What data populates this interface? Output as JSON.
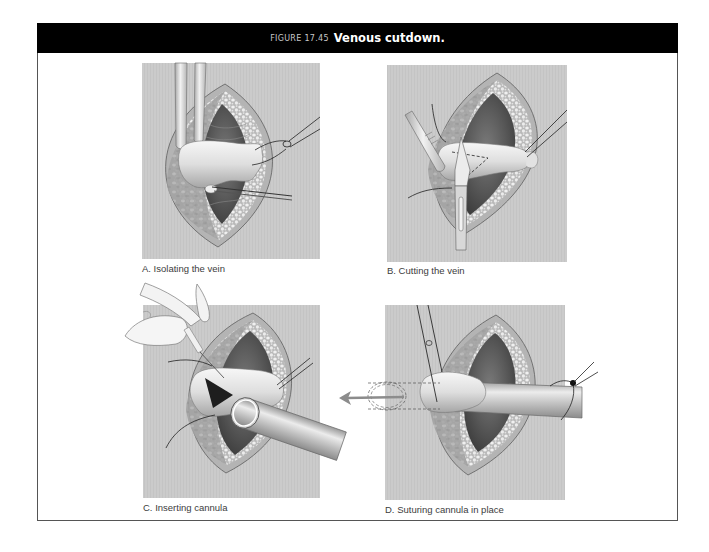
{
  "figure": {
    "number_label": "FIGURE 17.45",
    "title": "Venous cutdown."
  },
  "panels": [
    {
      "id": "A",
      "caption": "A. Isolating the vein"
    },
    {
      "id": "B",
      "caption": "B. Cutting the vein"
    },
    {
      "id": "C",
      "caption": "C. Inserting cannula"
    },
    {
      "id": "D",
      "caption": "D. Suturing cannula in place"
    }
  ],
  "colors": {
    "header_bg": "#000000",
    "header_text": "#ffffff",
    "panel_bg": "#cacaca",
    "direction_arrow": "#8c8c8c"
  },
  "icons": {
    "direction_arrow": "left-arrow"
  }
}
